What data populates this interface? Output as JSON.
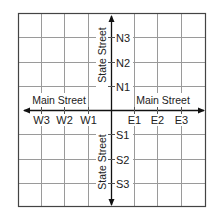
{
  "diagram": {
    "type": "coordinate-street-grid",
    "colors": {
      "grid": "#9a9a9a",
      "border": "#444444",
      "axis": "#111111",
      "text": "#222222",
      "background": "#ffffff"
    },
    "streets": {
      "horizontal": {
        "name": "Main Street",
        "left_label": "Main Street",
        "right_label": "Main Street"
      },
      "vertical": {
        "name": "State Street",
        "top_label": "State Street",
        "bottom_label": "State Street"
      }
    },
    "west_labels": [
      "W3",
      "W2",
      "W1"
    ],
    "east_labels": [
      "E1",
      "E2",
      "E3"
    ],
    "north_labels": [
      "N3",
      "N2",
      "N1"
    ],
    "south_labels": [
      "S1",
      "S2",
      "S3"
    ]
  }
}
